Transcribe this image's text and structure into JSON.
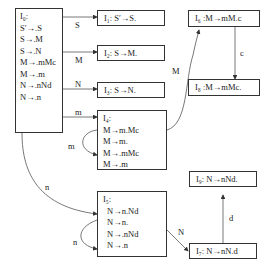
{
  "diagram": {
    "type": "LR(0) item-set automaton (DFA)",
    "states": [
      {
        "id": "I0",
        "title": "I₀:",
        "items": [
          "S′→.S",
          "S→.M",
          "S→.N",
          "M→.mMc",
          "M→.m",
          "N→.nNd",
          "N→.n"
        ]
      },
      {
        "id": "I1",
        "label": "I₁:  S′→S."
      },
      {
        "id": "I2",
        "label": "I₂:  S→M."
      },
      {
        "id": "I3",
        "label": "I₃:  S→N."
      },
      {
        "id": "I4",
        "title": "I₄:",
        "items": [
          "M→m.Mc",
          "M→m.",
          "M→.mMc",
          "M→.m"
        ]
      },
      {
        "id": "I5",
        "title": "I₅:",
        "items": [
          "N→n.Nd",
          "N→n.",
          "N→.nNd",
          "N→.n"
        ]
      },
      {
        "id": "I6",
        "label": "I₆ :M→mM.c"
      },
      {
        "id": "I7",
        "label": "I₇: N→nN.d"
      },
      {
        "id": "I8",
        "label": "I₈ :M→mMc."
      },
      {
        "id": "I9",
        "label": "I₉: N→nNd."
      }
    ],
    "transitions": [
      {
        "from": "I0",
        "to": "I1",
        "symbol": "S"
      },
      {
        "from": "I0",
        "to": "I2",
        "symbol": "M"
      },
      {
        "from": "I0",
        "to": "I3",
        "symbol": "N"
      },
      {
        "from": "I0",
        "to": "I4",
        "symbol": "m"
      },
      {
        "from": "I0",
        "to": "I5",
        "symbol": "n"
      },
      {
        "from": "I4",
        "to": "I4",
        "symbol": "m"
      },
      {
        "from": "I4",
        "to": "I6",
        "symbol": "M"
      },
      {
        "from": "I6",
        "to": "I8",
        "symbol": "c"
      },
      {
        "from": "I5",
        "to": "I5",
        "symbol": "n"
      },
      {
        "from": "I5",
        "to": "I7",
        "symbol": "N"
      },
      {
        "from": "I7",
        "to": "I9",
        "symbol": "d"
      }
    ]
  }
}
